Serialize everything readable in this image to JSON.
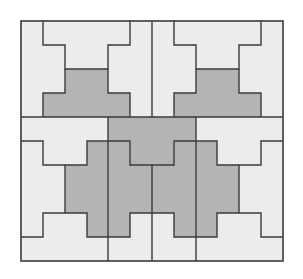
{
  "figure": {
    "colors": {
      "background": "#ffffff",
      "light_piece": "#ececec",
      "dark_piece": "#b4b4b4",
      "outline": "#3a3a3a"
    },
    "grid": {
      "columns": 12,
      "rows": 10,
      "upper_section_rows": 4,
      "lower_section_rows": 6
    }
  }
}
